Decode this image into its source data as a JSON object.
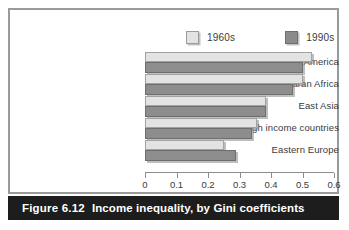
{
  "figure": {
    "number_label": "Figure 6.12",
    "caption": "Income inequality, by Gini coefficients"
  },
  "legend": {
    "position": "top-right",
    "items": [
      {
        "label": "1960s",
        "color": "#e3e3e3",
        "swatch": "light-square-icon"
      },
      {
        "label": "1990s",
        "color": "#8d8d8d",
        "swatch": "dark-square-icon"
      }
    ]
  },
  "axis": {
    "ticks": [
      "0",
      "0.1",
      "0.2",
      "0.3",
      "0.4",
      "0.5",
      "0.6"
    ],
    "min": 0,
    "max": 0.6
  },
  "chart_data": {
    "type": "bar",
    "orientation": "horizontal",
    "title": "Income inequality, by Gini coefficients",
    "xlabel": "",
    "ylabel": "",
    "xlim": [
      0,
      0.6
    ],
    "grid": false,
    "legend_position": "top-right",
    "categories": [
      "Latin America",
      "Sub–Saharan Africa",
      "East Asia",
      "High income countries",
      "Eastern Europe"
    ],
    "series": [
      {
        "name": "1960s",
        "color": "#e3e3e3",
        "values": [
          0.53,
          0.5,
          0.385,
          0.355,
          0.25
        ]
      },
      {
        "name": "1990s",
        "color": "#8d8d8d",
        "values": [
          0.5,
          0.47,
          0.385,
          0.34,
          0.29
        ]
      }
    ]
  }
}
